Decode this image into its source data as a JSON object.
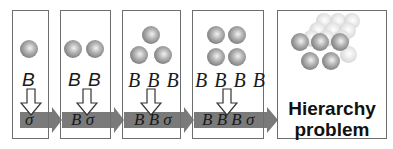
{
  "panels": [
    {
      "balls": 1,
      "label": "B",
      "band_text": "σ"
    },
    {
      "balls": 2,
      "label": "B B",
      "band_text": "B σ"
    },
    {
      "balls": 3,
      "label": "B B B",
      "band_text": "B B σ"
    },
    {
      "balls": 4,
      "label": "B B B B",
      "band_text": "B B B σ"
    },
    {
      "balls": "many",
      "title_line1": "Hierarchy",
      "title_line2": "problem"
    }
  ],
  "colors": {
    "band": "#7a7a7a",
    "border": "#6e6e6e",
    "text": "#1a1a1a"
  }
}
